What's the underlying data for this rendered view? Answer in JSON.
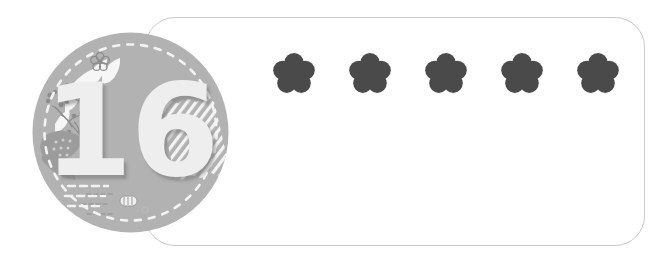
{
  "page": {
    "background_color": "#ffffff",
    "width": 662,
    "height": 261
  },
  "badge": {
    "name": "number-badge",
    "number": "16",
    "circle_color": "#b2b2b2",
    "number_color": "#eeeeee",
    "shadow_color": "#787878",
    "decorations": [
      {
        "name": "dashed-ring",
        "color": "#f2f2f2",
        "style": "dashed-circle"
      },
      {
        "name": "leaf-spray-icon",
        "color": "#f5f5f5",
        "position": "top-left"
      },
      {
        "name": "flower-sprig-icon",
        "color": "#8e8e8e",
        "position": "upper-left"
      },
      {
        "name": "small-flower-icon",
        "color": "#8e8e8e",
        "position": "top"
      },
      {
        "name": "feather-leaf-icon",
        "color": "#8e8e8e",
        "position": "left"
      },
      {
        "name": "dashed-lines-icon",
        "color": "#f2f2f2",
        "position": "lower-left"
      },
      {
        "name": "diagonal-hatch-icon",
        "color": "#f5f5f5",
        "position": "right"
      },
      {
        "name": "tiny-marks-icon",
        "color": "#9a9a9a",
        "position": "bottom"
      }
    ]
  },
  "answer_frame": {
    "name": "answer-frame",
    "border_color": "#c9c9c9",
    "fill_color": "#ffffff",
    "corner_radius": 30
  },
  "flowers": {
    "count": 5,
    "color": "#4a4a4a",
    "items": [
      {
        "label": "flower-1"
      },
      {
        "label": "flower-2"
      },
      {
        "label": "flower-3"
      },
      {
        "label": "flower-4"
      },
      {
        "label": "flower-5"
      }
    ]
  }
}
